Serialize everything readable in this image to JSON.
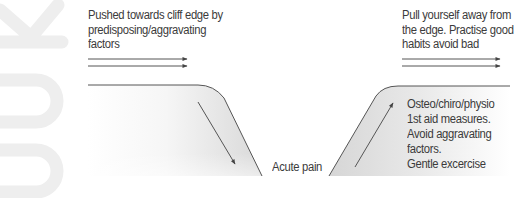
{
  "watermark": {
    "text": "OOK",
    "color": "#eeeeee"
  },
  "left": {
    "caption_lines": [
      "Pushed towards cliff edge by",
      "predisposing/aggravating",
      "factors"
    ],
    "arrows": 2,
    "slope_arrow_direction": "down"
  },
  "right": {
    "caption_lines": [
      "Pull yourself away from",
      "the edge. Practise good",
      "habits avoid bad"
    ],
    "arrows": 2,
    "slope_arrow_direction": "up",
    "treatment_lines": [
      "Osteo/chiro/physio",
      "1st aid measures.",
      "Avoid aggravating",
      "factors.",
      "Gentle excercise"
    ]
  },
  "center": {
    "label": "Acute pain"
  },
  "colors": {
    "text": "#3b3b3b",
    "line": "#555555",
    "cliff_fill_dark": "#d8d8d8",
    "cliff_fill_light": "#ffffff"
  }
}
